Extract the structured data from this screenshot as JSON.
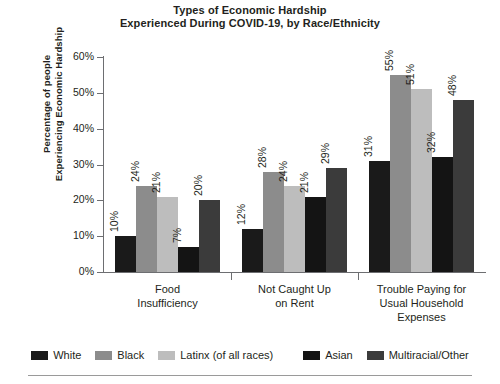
{
  "chart_data": {
    "type": "bar",
    "title": "Types of Economic Hardship Experienced During COVID-19, by Race/Ethnicity",
    "title_lines": [
      "Types of Economic Hardship",
      "Experienced During COVID-19, by Race/Ethnicity"
    ],
    "xlabel": "",
    "ylabel": "Percentage of people Experiencing Economic Hardship",
    "ylabel_lines": [
      "Percentage of people",
      "Experiencing Economic Hardship"
    ],
    "ylim": [
      0,
      60
    ],
    "ytick_values": [
      0,
      10,
      20,
      30,
      40,
      50,
      60
    ],
    "ytick_labels": [
      "0%",
      "10%",
      "20%",
      "30%",
      "40%",
      "50%",
      "60%"
    ],
    "grid": false,
    "legend_position": "bottom",
    "categories": [
      "Food Insufficiency",
      "Not Caught Up on Rent",
      "Trouble Paying for Usual Household Expenses"
    ],
    "category_lines": [
      [
        "Food",
        "Insufficiency"
      ],
      [
        "Not Caught Up",
        "on Rent"
      ],
      [
        "Trouble Paying for",
        "Usual Household",
        "Expenses"
      ]
    ],
    "series": [
      {
        "name": "White",
        "color": "#1a1a1a",
        "values": [
          10,
          12,
          31
        ],
        "labels": [
          "10%",
          "12%",
          "31%"
        ]
      },
      {
        "name": "Black",
        "color": "#8c8c8c",
        "values": [
          24,
          28,
          55
        ],
        "labels": [
          "24%",
          "28%",
          "55%"
        ]
      },
      {
        "name": "Latinx (of all races)",
        "color": "#bdbdbd",
        "values": [
          21,
          24,
          51
        ],
        "labels": [
          "21%",
          "24%",
          "51%"
        ]
      },
      {
        "name": "Asian",
        "color": "#141414",
        "values": [
          7,
          21,
          32
        ],
        "labels": [
          "7%",
          "21%",
          "32%"
        ]
      },
      {
        "name": "Multiracial/Other",
        "color": "#3b3b3b",
        "values": [
          20,
          29,
          48
        ],
        "labels": [
          "20%",
          "29%",
          "48%"
        ]
      }
    ]
  },
  "legend": {
    "items": [
      {
        "label": "White",
        "color": "#1a1a1a"
      },
      {
        "label": "Black",
        "color": "#8c8c8c"
      },
      {
        "label": "Latinx (of all races)",
        "color": "#bdbdbd"
      },
      {
        "label": "Asian",
        "color": "#141414"
      },
      {
        "label": "Multiracial/Other",
        "color": "#3b3b3b"
      }
    ]
  }
}
